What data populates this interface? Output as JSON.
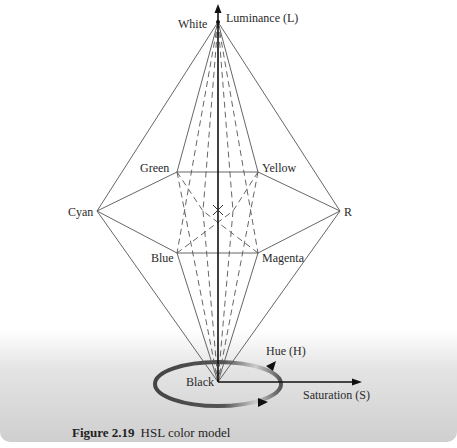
{
  "figure": {
    "number": "Figure 2.19",
    "title": "HSL color model"
  },
  "axes": {
    "luminance_label": "Luminance (L)",
    "hue_label": "Hue (H)",
    "saturation_label": "Saturation (S)"
  },
  "vertices": {
    "top": "White",
    "bottom": "Black",
    "left": "Cyan",
    "right": "R",
    "upper_left": "Green",
    "upper_right": "Yellow",
    "lower_left": "Blue",
    "lower_right": "Magenta"
  },
  "colors": {
    "line": "#444444",
    "axis": "#111111",
    "band_light": "#e4e4e4",
    "band_dark": "#cfcfcf"
  }
}
